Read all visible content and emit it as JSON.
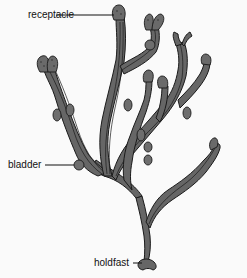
{
  "diagram": {
    "labels": {
      "receptacle": "receptacle",
      "bladder": "bladder",
      "holdfast": "holdfast"
    },
    "colors": {
      "thallus": "#666666",
      "outline": "#1a1a1a",
      "background": "#fafafa",
      "text": "#111111"
    }
  }
}
